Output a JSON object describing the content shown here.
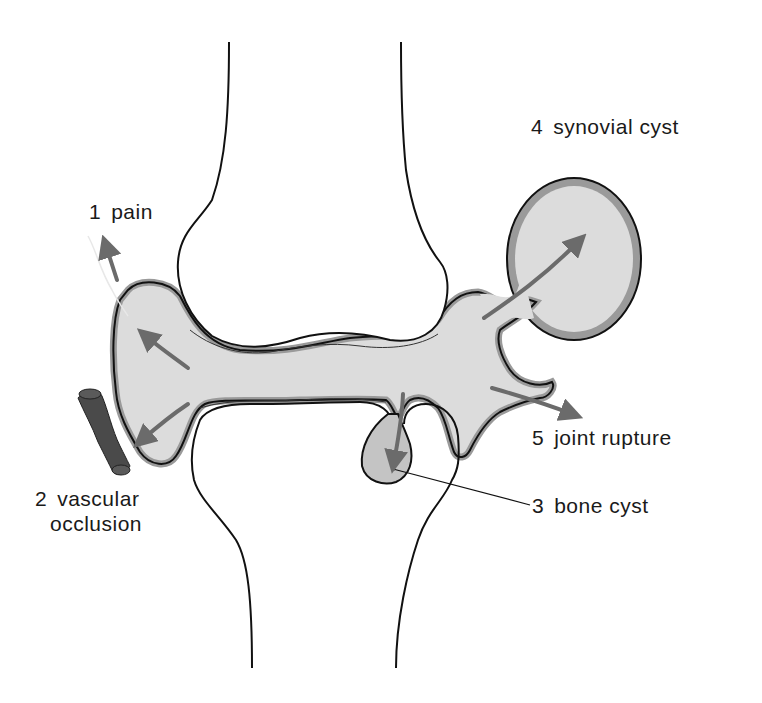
{
  "diagram": {
    "colors": {
      "background": "#ffffff",
      "outline": "#111111",
      "synovial_fill": "#dcdcdc",
      "synovial_rim": "#9a9a9a",
      "arrow": "#6b6b6b",
      "vessel": "#4a4a4a",
      "bone_cyst_fill": "#c4c4c4"
    },
    "labels": [
      {
        "number": "1",
        "text": "pain"
      },
      {
        "number": "2",
        "text": "vascular"
      },
      {
        "number": "",
        "text": "occlusion"
      },
      {
        "number": "3",
        "text": "bone cyst"
      },
      {
        "number": "4",
        "text": "synovial cyst"
      },
      {
        "number": "5",
        "text": "joint rupture"
      }
    ]
  }
}
